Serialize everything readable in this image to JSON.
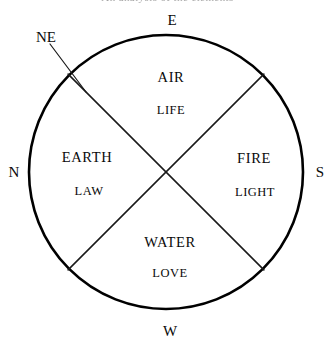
{
  "figure": {
    "title_partial": "An analysis of the elements",
    "background_color": "#ffffff",
    "ink_color": "#000000"
  },
  "cardinals": [
    {
      "id": "east",
      "label": "E",
      "position": "top"
    },
    {
      "id": "south",
      "label": "S",
      "position": "right"
    },
    {
      "id": "west",
      "label": "W",
      "position": "bottom"
    },
    {
      "id": "north",
      "label": "N",
      "position": "left"
    },
    {
      "id": "northeast",
      "label": "NE",
      "position": "upper-left-outside"
    }
  ],
  "quadrants": [
    {
      "id": "air",
      "element": "AIR",
      "attribute": "LIFE",
      "position": "top"
    },
    {
      "id": "fire",
      "element": "FIRE",
      "attribute": "LIGHT",
      "position": "right"
    },
    {
      "id": "water",
      "element": "WATER",
      "attribute": "LOVE",
      "position": "bottom"
    },
    {
      "id": "earth",
      "element": "EARTH",
      "attribute": "LAW",
      "position": "left"
    }
  ],
  "geometry": {
    "center_x": 166,
    "center_y": 172,
    "radius": 137,
    "circle_stroke_width": 2.6,
    "divider_stroke_width": 1.5,
    "pointer_stroke_width": 1.2
  }
}
